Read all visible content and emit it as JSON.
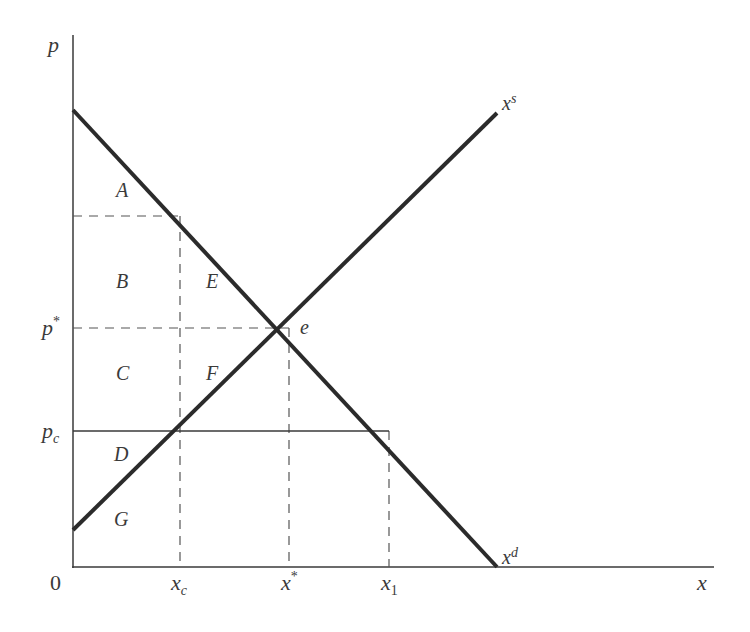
{
  "diagram": {
    "axes": {
      "y_label": "p",
      "x_label": "x",
      "origin_label": "0"
    },
    "y_ticks": [
      {
        "main": "p",
        "sup": "*",
        "sub": ""
      },
      {
        "main": "p",
        "sup": "",
        "sub": "c"
      }
    ],
    "x_ticks": [
      {
        "main": "x",
        "sup": "",
        "sub": "c"
      },
      {
        "main": "x",
        "sup": "*",
        "sub": ""
      },
      {
        "main": "x",
        "sup": "",
        "sub": "1"
      }
    ],
    "curves": {
      "supply": {
        "main": "x",
        "sup": "s"
      },
      "demand": {
        "main": "x",
        "sup": "d"
      }
    },
    "equilibrium_label": "e",
    "regions": [
      "A",
      "B",
      "C",
      "D",
      "E",
      "F",
      "G"
    ],
    "colors": {
      "curve": "#2b2b2b",
      "axis": "#3a3a3a",
      "dashed": "#555555",
      "text": "#3a3a3a"
    }
  }
}
